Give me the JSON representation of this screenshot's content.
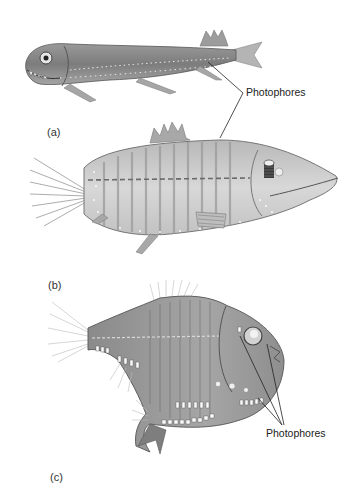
{
  "figure": {
    "panels": [
      {
        "id": "a",
        "label": "(a)",
        "subject": "dragonfish"
      },
      {
        "id": "b",
        "label": "(b)",
        "subject": "lanternfish-like fish"
      },
      {
        "id": "c",
        "label": "(c)",
        "subject": "hatchetfish"
      }
    ],
    "annotations": [
      {
        "id": "top",
        "text": "Photophores"
      },
      {
        "id": "bottom",
        "text": "Photophores"
      }
    ],
    "colors": {
      "background": "#ffffff",
      "ink": "#222222",
      "body_dark": "#6d6d6d",
      "body_mid": "#9a9a9a",
      "body_light": "#c9c9c9",
      "photophore": "#f4f4f4"
    }
  }
}
